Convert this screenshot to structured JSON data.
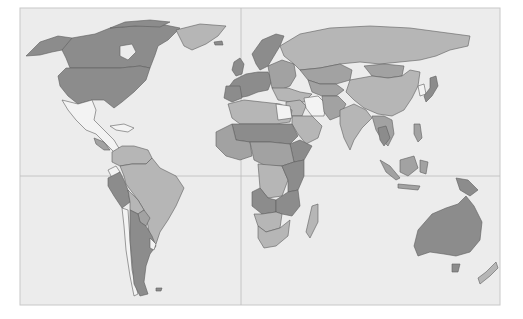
{
  "map": {
    "type": "choropleth-world",
    "projection": "equirectangular-like",
    "frame": {
      "x": 20,
      "y": 8,
      "width": 480,
      "height": 297
    },
    "gridlines": {
      "equator_y": 176,
      "prime_meridian_x": 241
    },
    "colors": {
      "page_background": "#ffffff",
      "ocean": "#ececec",
      "frame_border": "#c8c8c8",
      "gridline": "#bdbdbd",
      "border": "#5e5e5e",
      "class_none": "#f3f3f3",
      "class_light": "#b6b6b6",
      "class_mid": "#a2a2a2",
      "class_dark": "#8c8c8c"
    },
    "legend": null,
    "title": null
  },
  "regions": [
    {
      "name": "Canada",
      "class": "dark"
    },
    {
      "name": "United States",
      "class": "dark"
    },
    {
      "name": "Alaska",
      "class": "dark"
    },
    {
      "name": "Greenland",
      "class": "light"
    },
    {
      "name": "Mexico & Central America",
      "class": "none"
    },
    {
      "name": "Caribbean",
      "class": "none"
    },
    {
      "name": "Colombia / Venezuela",
      "class": "light"
    },
    {
      "name": "Brazil",
      "class": "light"
    },
    {
      "name": "Peru",
      "class": "dark"
    },
    {
      "name": "Bolivia",
      "class": "light"
    },
    {
      "name": "Chile",
      "class": "none"
    },
    {
      "name": "Argentina",
      "class": "dark"
    },
    {
      "name": "Uruguay",
      "class": "none"
    },
    {
      "name": "Western Europe",
      "class": "dark"
    },
    {
      "name": "Scandinavia",
      "class": "dark"
    },
    {
      "name": "Eastern Europe",
      "class": "mid"
    },
    {
      "name": "Russia",
      "class": "light"
    },
    {
      "name": "Kazakhstan / Central Asia",
      "class": "mid"
    },
    {
      "name": "Mongolia",
      "class": "mid"
    },
    {
      "name": "China",
      "class": "light"
    },
    {
      "name": "Japan",
      "class": "dark"
    },
    {
      "name": "Korea",
      "class": "none"
    },
    {
      "name": "Middle East",
      "class": "light"
    },
    {
      "name": "Iran",
      "class": "none"
    },
    {
      "name": "Arabian Peninsula",
      "class": "light"
    },
    {
      "name": "India",
      "class": "light"
    },
    {
      "name": "Southeast Asia",
      "class": "mid"
    },
    {
      "name": "Indonesia",
      "class": "mid"
    },
    {
      "name": "Papua New Guinea",
      "class": "dark"
    },
    {
      "name": "North Africa",
      "class": "light"
    },
    {
      "name": "Sahel",
      "class": "dark"
    },
    {
      "name": "West Africa",
      "class": "mid"
    },
    {
      "name": "Central Africa",
      "class": "mid"
    },
    {
      "name": "DR Congo",
      "class": "light"
    },
    {
      "name": "East Africa",
      "class": "dark"
    },
    {
      "name": "Angola",
      "class": "dark"
    },
    {
      "name": "Southern Africa",
      "class": "light"
    },
    {
      "name": "Madagascar",
      "class": "light"
    },
    {
      "name": "Australia",
      "class": "dark"
    },
    {
      "name": "New Zealand",
      "class": "light"
    }
  ]
}
